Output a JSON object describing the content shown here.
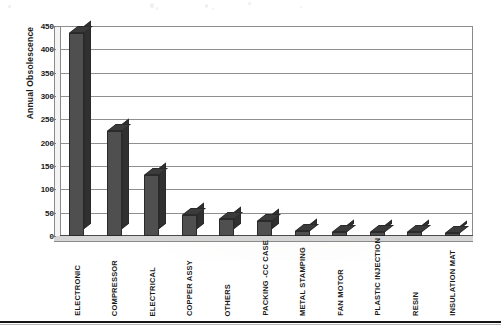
{
  "chart_data": {
    "type": "bar",
    "title": "",
    "xlabel": "",
    "ylabel": "Annual Obsolescence",
    "ylim": [
      0,
      450
    ],
    "ytick_step": 50,
    "yticks": [
      450,
      400,
      350,
      300,
      250,
      200,
      150,
      100,
      50,
      0
    ],
    "grid": true,
    "legend": "none",
    "style": "3d-column",
    "bar_color": "#4f4f4f",
    "categories": [
      "ELECTRONIC",
      "COMPRESSOR",
      "ELECTRICAL",
      "COPPER ASSY",
      "OTHERS",
      "PACKING -CC CASE",
      "METAL STAMPING",
      "FAN MOTOR",
      "PLASTIC INJECTION",
      "RESIN",
      "INSULATION MAT"
    ],
    "values": [
      435,
      225,
      131,
      45,
      36,
      32,
      10,
      9,
      8,
      8,
      7
    ]
  },
  "axis": {
    "y_title": "Annual Obsolescence",
    "tick_labels": [
      "450",
      "400",
      "350",
      "300",
      "250",
      "200",
      "150",
      "100",
      "50",
      "0"
    ]
  }
}
